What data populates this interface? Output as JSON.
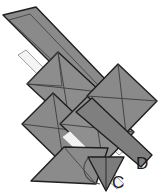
{
  "figure": {
    "background_color": "#ffffff",
    "fill_color": "#8a8a8a",
    "fill_color_light": "#9a9a9a",
    "fill_color_dark": "#6f6f6f",
    "stroke_color": "#1e1e1e",
    "highlight_color": "#f2f2f2",
    "stroke_width": 1.4,
    "labels": [
      {
        "id": "label-c",
        "text": "C",
        "x": 113,
        "y": 186
      },
      {
        "id": "label-d",
        "text": "D",
        "x": 136,
        "y": 168
      }
    ],
    "shapes": [
      {
        "name": "long-diagonal-bar",
        "type": "polygon",
        "points": "4,14 38,8 122,97 104,119"
      },
      {
        "name": "left-diamond-upper",
        "type": "polygon",
        "points": "37,72 59,50 100,90 78,112"
      },
      {
        "name": "left-diamond-lower",
        "type": "polygon",
        "points": "28,122 50,100 92,141 70,163"
      },
      {
        "name": "center-diamond",
        "type": "polygon",
        "points": "73,115 96,92 138,133 115,156"
      },
      {
        "name": "right-diamond-upper",
        "type": "polygon",
        "points": "96,83 119,60 155,96 133,118"
      },
      {
        "name": "lower-bar",
        "type": "polygon",
        "points": "35,180 62,152 128,148 142,162"
      },
      {
        "name": "lower-right-triangle",
        "type": "polygon",
        "points": "89,160 122,160 106,192"
      },
      {
        "name": "arc-annotation",
        "type": "arc"
      }
    ]
  }
}
